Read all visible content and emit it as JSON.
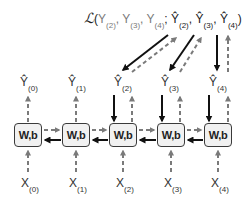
{
  "diagram": {
    "loss": {
      "symbol": "ℒ",
      "open": "(",
      "targets": [
        {
          "base": "Y",
          "sub": "(2)"
        },
        {
          "base": "Y",
          "sub": "(3)"
        },
        {
          "base": "Y",
          "sub": "(4)"
        }
      ],
      "separator": ";",
      "predictions": [
        {
          "base": "Ŷ",
          "sub": "(2)"
        },
        {
          "base": "Ŷ",
          "sub": "(3)"
        },
        {
          "base": "Ŷ",
          "sub": "(4)"
        }
      ],
      "close": ")"
    },
    "cells": [
      {
        "label": "W,b",
        "x": 14
      },
      {
        "label": "W,b",
        "x": 62
      },
      {
        "label": "W,b",
        "x": 109
      },
      {
        "label": "W,b",
        "x": 157
      },
      {
        "label": "W,b",
        "x": 204
      }
    ],
    "outputs": [
      {
        "base": "Ŷ",
        "sub": "(0)"
      },
      {
        "base": "Ŷ",
        "sub": "(1)"
      },
      {
        "base": "Ŷ",
        "sub": "(2)"
      },
      {
        "base": "Ŷ",
        "sub": "(3)"
      },
      {
        "base": "Ŷ",
        "sub": "(4)"
      }
    ],
    "inputs": [
      {
        "base": "X",
        "sub": "(0)"
      },
      {
        "base": "X",
        "sub": "(1)"
      },
      {
        "base": "X",
        "sub": "(2)"
      },
      {
        "base": "X",
        "sub": "(3)"
      },
      {
        "base": "X",
        "sub": "(4)"
      }
    ],
    "legend_semantics": {
      "dashed_gray": "forward pass",
      "solid_black": "backpropagation of gradients"
    },
    "colors": {
      "forward": "#7a7a7a",
      "backward": "#111111",
      "cell_fill": "#f1f1f1",
      "cell_border": "#3a3a3a"
    }
  }
}
